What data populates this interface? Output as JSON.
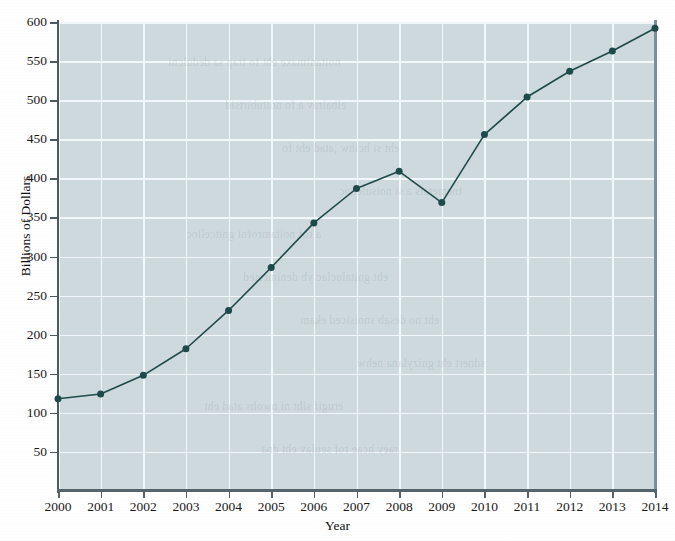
{
  "figure": {
    "background_color": "#ffffff",
    "plot_background_color": "#ced9dd",
    "grid_color": "#f2f7f9",
    "series_color": "#1e4a4a",
    "axis_color": "#4a5a60"
  },
  "chart_data": {
    "type": "line",
    "title": "",
    "xlabel": "Year",
    "ylabel": "Billions of Dollars",
    "categories": [
      2000,
      2001,
      2002,
      2003,
      2004,
      2005,
      2006,
      2007,
      2008,
      2009,
      2010,
      2011,
      2012,
      2013,
      2014
    ],
    "x_tick_labels": [
      "2000",
      "2001",
      "2002",
      "2003",
      "2004",
      "2005",
      "2006",
      "2007",
      "2008",
      "2009",
      "2010",
      "2011",
      "2012",
      "2013",
      "2014"
    ],
    "values": [
      118,
      124,
      148,
      182,
      231,
      286,
      343,
      387,
      409,
      369,
      456,
      504,
      537,
      563,
      592
    ],
    "y_tick_labels": [
      "600",
      "550",
      "500",
      "450",
      "400",
      "350",
      "300",
      "250",
      "200",
      "150",
      "100",
      "50"
    ],
    "y_ticks": [
      600,
      550,
      500,
      450,
      400,
      350,
      300,
      250,
      200,
      150,
      100,
      50
    ],
    "ylim": [
      0,
      600
    ],
    "xlim": [
      2000,
      2014
    ],
    "grid": true,
    "grid_axis": "both",
    "legend": false,
    "legend_position": "none",
    "marker": "circle",
    "marker_size": 7,
    "line_width": 1.6
  },
  "bleedthrough": {
    "lines": [
      "noitanimaxe eht fo trap sa dedulcni",
      "elbairav a fo noitubirtsid",
      "eht si hcihw ,atad eht fo",
      "tnemetats a si noisulcnoc",
      "a rof noitamrofni gnitcelloc",
      "eht gnitaluclac yb denimreted",
      "eht no desab snoisiced ekam",
      "sdnert eht gnizylana nehw",
      "erugif siht ni nwohs atad eht",
      "raey hcae rof seulav eht dna"
    ]
  }
}
